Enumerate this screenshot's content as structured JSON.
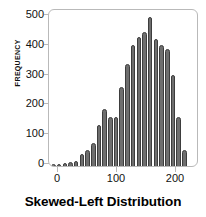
{
  "chart_data": {
    "type": "bar",
    "title": "Skewed-Left Distribution",
    "xlabel": "",
    "ylabel": "Frequency",
    "ylim": [
      0,
      530
    ],
    "xlim": [
      -2,
      232
    ],
    "grid": false,
    "legend": null,
    "bar_color": "#6e6e6e",
    "bar_edge_color": "#3d3d3d",
    "frame_color": "#b9b9b9",
    "yticks": [
      0,
      100,
      200,
      300,
      400,
      500
    ],
    "ytick_labels": [
      "0",
      "100",
      "200",
      "300",
      "400",
      "500"
    ],
    "xticks": [
      0,
      100,
      200
    ],
    "xtick_labels": [
      "0",
      "100",
      "200"
    ],
    "bin_width": 9,
    "categories": [
      5,
      14,
      23,
      32,
      41,
      50,
      59,
      68,
      77,
      86,
      95,
      104,
      113,
      122,
      131,
      140,
      149,
      158,
      167,
      176,
      185,
      194,
      203,
      212,
      221
    ],
    "values": [
      8,
      8,
      9,
      12,
      18,
      42,
      55,
      78,
      140,
      195,
      165,
      167,
      268,
      345,
      410,
      438,
      455,
      505,
      430,
      412,
      398,
      308,
      165,
      55,
      0
    ]
  },
  "figure": {
    "title_text": "Skewed-Left Distribution",
    "ylabel_text": "Frequency"
  }
}
